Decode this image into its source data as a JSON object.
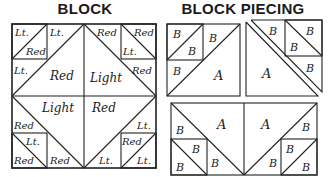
{
  "titles": {
    "block": "BLOCK",
    "piecing": "BLOCK PIECING"
  },
  "block": {
    "top_left_small": {
      "upper": "Lt.",
      "lower": "Red"
    },
    "top_left_tri": "Lt.",
    "left_mid_small": "Lt.",
    "top_left_large": "Red",
    "top_right_large": "Light",
    "top_right_tri": "Red",
    "top_right_small": {
      "upper": "Red",
      "lower": "Lt."
    },
    "right_mid_small": "Red",
    "bottom_left_large": "Light",
    "bottom_right_large": "Red",
    "left_mid_small_bottom": "Red",
    "bottom_left_small": {
      "upper": "Lt.",
      "lower": "Red"
    },
    "bottom_left_tri": "Red",
    "bottom_right_tri": "Lt.",
    "right_mid_small_bottom": "Lt.",
    "bottom_right_small": {
      "upper": "Red",
      "lower": "Lt."
    }
  },
  "piecing": {
    "top_left_unit": {
      "b1": "B",
      "b2": "B",
      "b3": "B",
      "b4": "B",
      "a": "A"
    },
    "top_right_unit": {
      "a": "A",
      "b1": "B",
      "b2": "B",
      "b3": "B",
      "b4": "B"
    },
    "bottom_unit": {
      "left_a": "A",
      "right_a": "A",
      "left_b": [
        "B",
        "B",
        "B",
        "B"
      ],
      "right_b": [
        "B",
        "B",
        "B",
        "B"
      ]
    }
  }
}
